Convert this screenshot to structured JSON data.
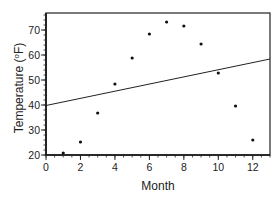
{
  "chart_data": {
    "type": "scatter",
    "title": "",
    "xlabel": "Month",
    "ylabel": "Temperature (°F)",
    "ylabel_parts": {
      "main": "Temperature (",
      "sup": "o",
      "unit": "F)"
    },
    "xlim": [
      0,
      13
    ],
    "ylim": [
      20,
      77
    ],
    "xticks": [
      0,
      2,
      4,
      6,
      8,
      10,
      12
    ],
    "yticks": [
      20,
      30,
      40,
      50,
      60,
      70
    ],
    "x_minor_step": 0.5,
    "y_minor_step": 2,
    "grid": false,
    "legend": null,
    "series": [
      {
        "name": "Monthly temperature",
        "kind": "points",
        "x": [
          1,
          2,
          3,
          4,
          5,
          6,
          7,
          8,
          9,
          10,
          11,
          12
        ],
        "y": [
          20.8,
          25.2,
          36.8,
          48.4,
          58.8,
          68.4,
          73.2,
          71.6,
          64.4,
          52.8,
          39.6,
          26.0
        ]
      },
      {
        "name": "Linear fit",
        "kind": "line",
        "x": [
          0,
          13
        ],
        "y": [
          39.8,
          58.4
        ]
      }
    ]
  }
}
